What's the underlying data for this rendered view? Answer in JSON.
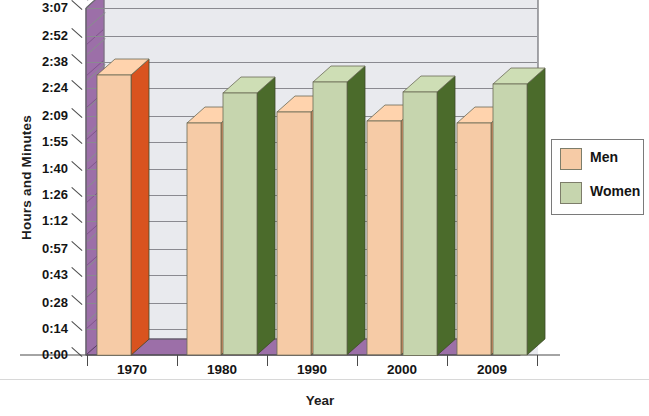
{
  "chart_data": {
    "type": "bar",
    "title": "Average Hours Worked per Day",
    "xlabel": "Year",
    "ylabel": "Hours and Minutes",
    "categories": [
      "1970",
      "1980",
      "1990",
      "2000",
      "2009"
    ],
    "ytick_labels": [
      "0:00",
      "0:14",
      "0:28",
      "0:43",
      "0:57",
      "1:12",
      "1:26",
      "1:40",
      "1:55",
      "2:09",
      "2:24",
      "2:38",
      "2:52",
      "3:07"
    ],
    "ytick_values_minutes": [
      0,
      14,
      28,
      43,
      57,
      72,
      86,
      100,
      115,
      129,
      144,
      158,
      172,
      187
    ],
    "ylim_minutes": [
      0,
      187
    ],
    "grid": true,
    "legend_position": "right",
    "series": [
      {
        "name": "Men",
        "color": "#f6cba6",
        "side_color": "#d9531f",
        "values_label": [
          "2:31",
          "2:05",
          "2:11",
          "2:06",
          "2:05"
        ],
        "values_minutes": [
          151,
          125,
          131,
          126,
          125
        ]
      },
      {
        "name": "Women",
        "color": "#c6d5ae",
        "side_color": "#4b6b2b",
        "values_label": [
          "",
          "2:21",
          "2:27",
          "2:22",
          "2:26"
        ],
        "values_minutes": [
          null,
          141,
          147,
          142,
          146
        ]
      }
    ]
  },
  "axis": {
    "y_title": "Hours and Minutes",
    "x_title": "Year"
  },
  "legend": {
    "items": [
      {
        "label": "Men",
        "color": "#f6cba6"
      },
      {
        "label": "Women",
        "color": "#c6d5ae"
      }
    ]
  },
  "colors": {
    "floor_purple": "#9c6fa8",
    "floor_purple_dark": "#7d5189",
    "wall": "#e9e9ee",
    "grid": "#8a8a90",
    "frame": "#6d6d72"
  }
}
